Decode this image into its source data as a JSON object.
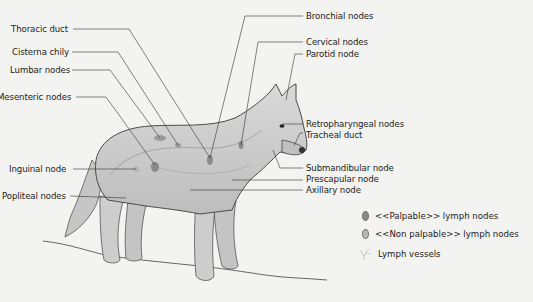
{
  "diagram": {
    "labels_left": [
      {
        "id": "thoracic-duct",
        "text": "Thoracic duct"
      },
      {
        "id": "cisterna-chily",
        "text": "Cisterna chily"
      },
      {
        "id": "lumbar-nodes",
        "text": "Lumbar nodes"
      },
      {
        "id": "mesenteric-nodes",
        "text": "Mesenteric nodes"
      },
      {
        "id": "inguinal-node",
        "text": "Inguinal node"
      },
      {
        "id": "popliteal-nodes",
        "text": "Popliteal nodes"
      }
    ],
    "labels_right": [
      {
        "id": "bronchial-nodes",
        "text": "Bronchial nodes"
      },
      {
        "id": "cervical-nodes",
        "text": "Cervical nodes"
      },
      {
        "id": "parotid-node",
        "text": "Parotid node"
      },
      {
        "id": "retropharyngeal-nodes",
        "text": "Retropharyngeal nodes"
      },
      {
        "id": "tracheal-duct",
        "text": "Tracheal duct"
      },
      {
        "id": "submandibular-node",
        "text": "Submandibular node"
      },
      {
        "id": "prescapular-node",
        "text": "Prescapular node"
      },
      {
        "id": "axillary-node",
        "text": "Axillary node"
      }
    ],
    "legend": [
      {
        "id": "palpable",
        "text": "<<Palpable>> lymph nodes",
        "color": "#8a8a8a"
      },
      {
        "id": "non-palpable",
        "text": "<<Non palpable>> lymph nodes",
        "color": "#b5b5b5"
      },
      {
        "id": "vessels",
        "text": "Lymph vessels",
        "color": "#c8c8c8"
      }
    ],
    "colors": {
      "background": "#f3f3f1",
      "body_fill": "#cfcfcf",
      "outline": "#4a4a4a",
      "leader_line": "#333333"
    }
  }
}
